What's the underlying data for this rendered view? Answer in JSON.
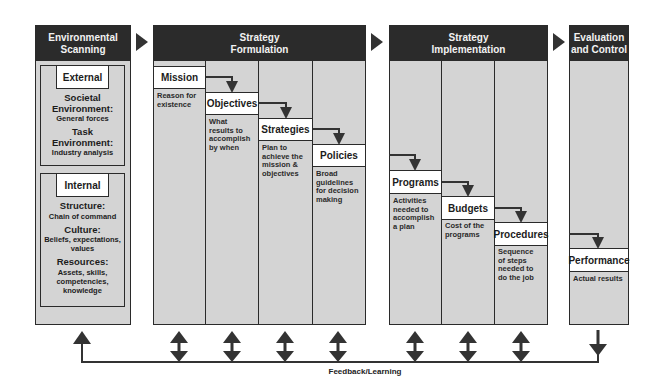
{
  "stages": {
    "scanning": {
      "title_line1": "Environmental",
      "title_line2": "Scanning",
      "external": {
        "label": "External",
        "societal_h1": "Societal",
        "societal_h2": "Environment:",
        "societal_sub": "General forces",
        "task_h1": "Task",
        "task_h2": "Environment:",
        "task_sub": "Industry analysis"
      },
      "internal": {
        "label": "Internal",
        "structure_h": "Structure:",
        "structure_sub": "Chain of command",
        "culture_h": "Culture:",
        "culture_sub1": "Beliefs, expectations,",
        "culture_sub2": "values",
        "resources_h": "Resources:",
        "resources_sub1": "Assets, skills,",
        "resources_sub2": "competencies,",
        "resources_sub3": "knowledge"
      }
    },
    "formulation": {
      "title_line1": "Strategy",
      "title_line2": "Formulation",
      "steps": [
        {
          "label": "Mission",
          "desc": [
            "Reason for",
            "existence"
          ]
        },
        {
          "label": "Objectives",
          "desc": [
            "What",
            "results to",
            "accomplish",
            "by when"
          ]
        },
        {
          "label": "Strategies",
          "desc": [
            "Plan to",
            "achieve the",
            "mission &",
            "objectives"
          ]
        },
        {
          "label": "Policies",
          "desc": [
            "Broad",
            "guidelines",
            "for decision",
            "making"
          ]
        }
      ]
    },
    "implementation": {
      "title_line1": "Strategy",
      "title_line2": "Implementation",
      "steps": [
        {
          "label": "Programs",
          "desc": [
            "Activities",
            "needed to",
            "accomplish",
            "a plan"
          ]
        },
        {
          "label": "Budgets",
          "desc": [
            "Cost of the",
            "programs"
          ]
        },
        {
          "label": "Procedures",
          "desc": [
            "Sequence",
            "of steps",
            "needed to",
            "do the job"
          ]
        }
      ]
    },
    "evaluation": {
      "title_line1": "Evaluation",
      "title_line2": "and Control",
      "steps": [
        {
          "label": "Performance",
          "desc": [
            "Actual results"
          ]
        }
      ]
    }
  },
  "feedback_label": "Feedback/Learning",
  "colors": {
    "header": "#2b2b2b",
    "panel": "#d4d4d4",
    "line": "#333333"
  }
}
